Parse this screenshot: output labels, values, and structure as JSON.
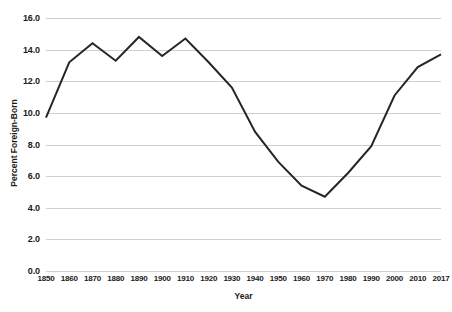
{
  "chart_data": {
    "type": "line",
    "title": "",
    "xlabel": "Year",
    "ylabel": "Percent Foreign-Born",
    "grid": true,
    "legend": false,
    "xlim": [
      1850,
      2017
    ],
    "ylim": [
      0.0,
      16.0
    ],
    "y_ticks": [
      "16.0",
      "14.0",
      "12.0",
      "10.0",
      "8.0",
      "6.0",
      "4.0",
      "2.0",
      "0.0"
    ],
    "y_tick_values": [
      16.0,
      14.0,
      12.0,
      10.0,
      8.0,
      6.0,
      4.0,
      2.0,
      0.0
    ],
    "categories": [
      "1850",
      "1860",
      "1870",
      "1880",
      "1890",
      "1900",
      "1910",
      "1920",
      "1930",
      "1940",
      "1950",
      "1960",
      "1970",
      "1980",
      "1990",
      "2000",
      "2010",
      "2017"
    ],
    "values": [
      9.7,
      13.2,
      14.4,
      13.3,
      14.8,
      13.6,
      14.7,
      13.2,
      11.6,
      8.8,
      6.9,
      5.4,
      4.7,
      6.2,
      7.9,
      11.1,
      12.9,
      13.7
    ],
    "series": [
      {
        "name": "Percent Foreign-Born",
        "color": "#262626",
        "values": [
          9.7,
          13.2,
          14.4,
          13.3,
          14.8,
          13.6,
          14.7,
          13.2,
          11.6,
          8.8,
          6.9,
          5.4,
          4.7,
          6.2,
          7.9,
          11.1,
          12.9,
          13.7
        ]
      }
    ],
    "colors": {
      "line": "#262626",
      "gridline": "#d0d0d0",
      "text": "#1a1a1a",
      "background": "#ffffff"
    }
  }
}
